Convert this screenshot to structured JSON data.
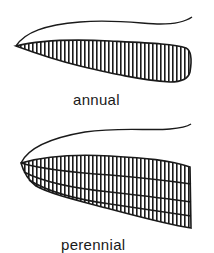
{
  "figure": {
    "ink_color": "#1a1a1a",
    "background": "#ffffff",
    "panels": [
      {
        "id": "annual",
        "label": "annual",
        "description": "leaf base with a single band of vertical striations"
      },
      {
        "id": "perennial",
        "label": "perennial",
        "description": "leaf base with multiple stacked bands of vertical striations"
      }
    ]
  }
}
